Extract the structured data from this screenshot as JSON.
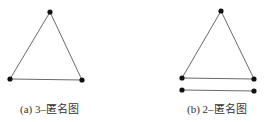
{
  "figures": [
    {
      "id": "a",
      "caption": "(a) 3–匿名图",
      "nodes": [
        "top",
        "bottom-left",
        "bottom-right"
      ],
      "edges": [
        [
          "top",
          "bottom-left"
        ],
        [
          "top",
          "bottom-right"
        ],
        [
          "bottom-left",
          "bottom-right"
        ]
      ]
    },
    {
      "id": "b",
      "caption": "(b) 2–匿名图",
      "nodes": [
        "top",
        "bottom-left",
        "bottom-right",
        "lower-left",
        "lower-right"
      ],
      "edges": [
        [
          "top",
          "bottom-left"
        ],
        [
          "top",
          "bottom-right"
        ],
        [
          "bottom-left",
          "bottom-right"
        ],
        [
          "lower-left",
          "lower-right"
        ]
      ]
    }
  ],
  "colors": {
    "edge": "#6a6a6a",
    "node": "#111111",
    "text": "#333333"
  }
}
